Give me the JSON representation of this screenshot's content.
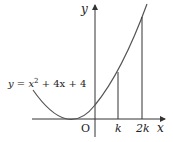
{
  "diagram": {
    "curve_label": {
      "prefix": "y = x",
      "exp": "2",
      "suffix": " + 4x + 4"
    },
    "axis_labels": {
      "x": "x",
      "y": "y",
      "origin": "O"
    },
    "tick_labels": {
      "k": "k",
      "two_k": "2k"
    },
    "colors": {
      "curve": "#555555",
      "axis": "#333333",
      "text": "#222222"
    }
  }
}
